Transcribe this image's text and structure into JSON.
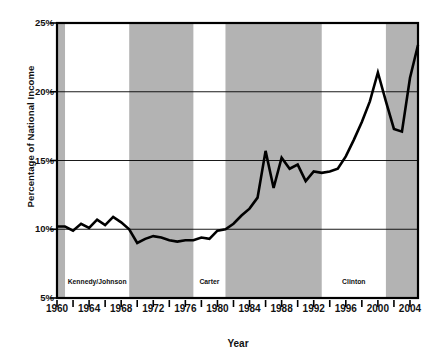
{
  "chart_data": {
    "type": "line",
    "title": "",
    "xlabel": "Year",
    "ylabel": "Percentage of National Income",
    "xlim": [
      1960,
      2005
    ],
    "ylim": [
      5,
      25
    ],
    "yticks": [
      5,
      10,
      15,
      20,
      25
    ],
    "ytick_labels": [
      "5%",
      "10%",
      "15%",
      "20%",
      "25%"
    ],
    "xticks": [
      1960,
      1962,
      1964,
      1966,
      1968,
      1970,
      1972,
      1974,
      1976,
      1978,
      1980,
      1982,
      1984,
      1986,
      1988,
      1990,
      1992,
      1994,
      1996,
      1998,
      2000,
      2002,
      2004
    ],
    "xtick_labels": [
      {
        "year": 1960,
        "label": "1960"
      },
      {
        "year": 1964,
        "label": "1964"
      },
      {
        "year": 1968,
        "label": "1968"
      },
      {
        "year": 1972,
        "label": "1972"
      },
      {
        "year": 1976,
        "label": "1976"
      },
      {
        "year": 1980,
        "label": "1980"
      },
      {
        "year": 1984,
        "label": "1984"
      },
      {
        "year": 1988,
        "label": "1988"
      },
      {
        "year": 1992,
        "label": "1992"
      },
      {
        "year": 1996,
        "label": "1996"
      },
      {
        "year": 2000,
        "label": "2000"
      },
      {
        "year": 2004,
        "label": "2004"
      }
    ],
    "grid": "horizontal",
    "legend": "none",
    "line_color": "#000000",
    "band_color": "#b3b3b3",
    "x": [
      1960,
      1961,
      1962,
      1963,
      1964,
      1965,
      1966,
      1967,
      1968,
      1969,
      1970,
      1971,
      1972,
      1973,
      1974,
      1975,
      1976,
      1977,
      1978,
      1979,
      1980,
      1981,
      1982,
      1983,
      1984,
      1985,
      1986,
      1987,
      1988,
      1989,
      1990,
      1991,
      1992,
      1993,
      1994,
      1995,
      1996,
      1997,
      1998,
      1999,
      2000,
      2001,
      2002,
      2003,
      2004,
      2005
    ],
    "values": [
      10.2,
      10.2,
      9.9,
      10.4,
      10.1,
      10.7,
      10.3,
      10.9,
      10.5,
      10.0,
      9.0,
      9.3,
      9.5,
      9.4,
      9.2,
      9.1,
      9.2,
      9.2,
      9.4,
      9.3,
      9.9,
      10.0,
      10.4,
      11.0,
      11.5,
      12.3,
      15.7,
      13.0,
      15.2,
      14.4,
      14.7,
      13.5,
      14.2,
      14.1,
      14.2,
      14.4,
      15.3,
      16.5,
      17.8,
      19.3,
      21.4,
      19.3,
      17.3,
      17.1,
      21.0,
      23.4
    ],
    "shaded_bands": [
      {
        "start": 1960,
        "end": 1961
      },
      {
        "start": 1969,
        "end": 1977
      },
      {
        "start": 1981,
        "end": 1993
      },
      {
        "start": 2001,
        "end": 2005
      }
    ],
    "era_labels": [
      {
        "label": "Kennedy/Johnson",
        "start": 1961,
        "end": 1969
      },
      {
        "label": "Nixon/Ford",
        "start": 1969,
        "end": 1977
      },
      {
        "label": "Carter",
        "start": 1977,
        "end": 1981
      },
      {
        "label": "Reagan/Bush",
        "start": 1981,
        "end": 1993
      },
      {
        "label": "Clinton",
        "start": 1993,
        "end": 2001
      },
      {
        "label": "Bush",
        "start": 2001,
        "end": 2005
      }
    ]
  }
}
